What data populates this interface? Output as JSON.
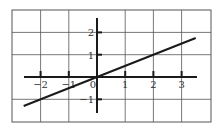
{
  "chart_data": {
    "type": "line",
    "title": "",
    "xlabel": "",
    "ylabel": "",
    "function": "y = x/2",
    "series": [
      {
        "name": "y = x/2",
        "x": [
          -2.6,
          3.5
        ],
        "y": [
          -1.3,
          1.75
        ]
      }
    ],
    "x_ticks": [
      -2,
      -1,
      0,
      1,
      2,
      3
    ],
    "y_ticks": [
      2,
      1,
      -1
    ],
    "x_tick_labels": [
      "−2",
      "−1",
      "0",
      "1",
      "2",
      "3"
    ],
    "y_tick_labels": [
      "2",
      "1",
      "−1"
    ],
    "xlim": [
      -3,
      4
    ],
    "ylim": [
      -2,
      3
    ],
    "grid": true,
    "legend": "none"
  },
  "colors": {
    "grid": "#555555",
    "axis": "#1a1a1a",
    "line": "#1a1a1a",
    "background": "#ffffff"
  }
}
